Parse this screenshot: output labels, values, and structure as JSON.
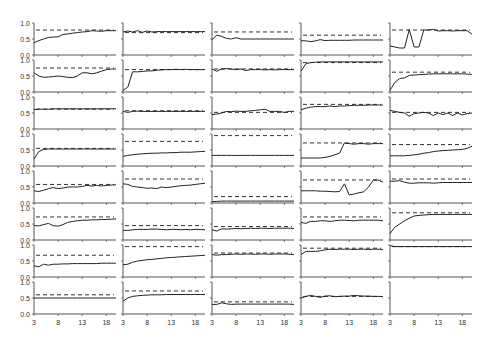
{
  "chart_data": {
    "type": "line",
    "layout": {
      "rows": 8,
      "cols": 5
    },
    "x": [
      3,
      4,
      5,
      6,
      7,
      8,
      9,
      10,
      11,
      12,
      13,
      14,
      15,
      16,
      17,
      18,
      19,
      20
    ],
    "xticks": [
      3,
      8,
      13,
      18
    ],
    "yticks": [
      0.0,
      0.5,
      1.0
    ],
    "ytick_labels": [
      "0.0",
      "0.5",
      "1.0"
    ],
    "xtick_labels": [
      "3",
      "8",
      "13",
      "18"
    ],
    "ylim": [
      0,
      1
    ],
    "xlim": [
      3,
      20
    ],
    "grid": false,
    "legend": null,
    "title": "",
    "xlabel": "",
    "ylabel": "",
    "series_style": {
      "solid": "observed",
      "dashed": "reference"
    },
    "panels": [
      {
        "row": 0,
        "col": 0,
        "ref": 0.78,
        "values": [
          0.38,
          0.45,
          0.5,
          0.55,
          0.56,
          0.57,
          0.64,
          0.66,
          0.68,
          0.7,
          0.72,
          0.73,
          0.76,
          0.75,
          0.74,
          0.76,
          0.76,
          0.76
        ]
      },
      {
        "row": 0,
        "col": 1,
        "ref": 0.7,
        "values": [
          0.72,
          0.75,
          0.72,
          0.76,
          0.71,
          0.75,
          0.72,
          0.73,
          0.73,
          0.73,
          0.73,
          0.73,
          0.73,
          0.73,
          0.73,
          0.73,
          0.73,
          0.73
        ]
      },
      {
        "row": 0,
        "col": 2,
        "ref": 0.72,
        "values": [
          0.48,
          0.62,
          0.58,
          0.52,
          0.5,
          0.54,
          0.5,
          0.5,
          0.5,
          0.5,
          0.5,
          0.5,
          0.5,
          0.5,
          0.5,
          0.5,
          0.5,
          0.5
        ]
      },
      {
        "row": 0,
        "col": 3,
        "ref": 0.62,
        "values": [
          0.45,
          0.44,
          0.42,
          0.44,
          0.48,
          0.45,
          0.46,
          0.46,
          0.46,
          0.46,
          0.46,
          0.47,
          0.47,
          0.47,
          0.47,
          0.47,
          0.47,
          0.47
        ]
      },
      {
        "row": 0,
        "col": 4,
        "ref": 0.78,
        "values": [
          0.28,
          0.25,
          0.22,
          0.22,
          0.8,
          0.25,
          0.25,
          0.78,
          0.78,
          0.8,
          0.75,
          0.76,
          0.76,
          0.75,
          0.76,
          0.76,
          0.76,
          0.65
        ]
      },
      {
        "row": 1,
        "col": 0,
        "ref": 0.75,
        "values": [
          0.6,
          0.5,
          0.46,
          0.47,
          0.48,
          0.5,
          0.48,
          0.46,
          0.45,
          0.5,
          0.6,
          0.6,
          0.57,
          0.6,
          0.65,
          0.7,
          0.72,
          0.72
        ]
      },
      {
        "row": 1,
        "col": 1,
        "ref": 0.7,
        "values": [
          0.05,
          0.15,
          0.63,
          0.63,
          0.64,
          0.66,
          0.66,
          0.68,
          0.69,
          0.7,
          0.7,
          0.71,
          0.7,
          0.71,
          0.7,
          0.7,
          0.7,
          0.7
        ]
      },
      {
        "row": 1,
        "col": 2,
        "ref": 0.72,
        "values": [
          0.72,
          0.65,
          0.72,
          0.73,
          0.72,
          0.7,
          0.72,
          0.67,
          0.7,
          0.7,
          0.7,
          0.69,
          0.7,
          0.69,
          0.7,
          0.7,
          0.7,
          0.7
        ]
      },
      {
        "row": 1,
        "col": 3,
        "ref": 0.92,
        "values": [
          0.65,
          0.88,
          0.92,
          0.93,
          0.94,
          0.94,
          0.94,
          0.94,
          0.94,
          0.94,
          0.94,
          0.94,
          0.94,
          0.94,
          0.94,
          0.94,
          0.94,
          0.94
        ]
      },
      {
        "row": 1,
        "col": 4,
        "ref": 0.62,
        "values": [
          0.05,
          0.3,
          0.42,
          0.44,
          0.52,
          0.53,
          0.54,
          0.55,
          0.56,
          0.57,
          0.57,
          0.57,
          0.57,
          0.57,
          0.57,
          0.57,
          0.56,
          0.55
        ]
      },
      {
        "row": 2,
        "col": 0,
        "ref": 0.62,
        "values": [
          0.6,
          0.62,
          0.62,
          0.62,
          0.63,
          0.63,
          0.63,
          0.63,
          0.63,
          0.63,
          0.63,
          0.63,
          0.63,
          0.63,
          0.63,
          0.63,
          0.63,
          0.63
        ]
      },
      {
        "row": 2,
        "col": 1,
        "ref": 0.57,
        "values": [
          0.55,
          0.52,
          0.55,
          0.56,
          0.55,
          0.55,
          0.55,
          0.55,
          0.55,
          0.55,
          0.55,
          0.55,
          0.55,
          0.55,
          0.55,
          0.55,
          0.55,
          0.55
        ]
      },
      {
        "row": 2,
        "col": 2,
        "ref": 0.52,
        "values": [
          0.45,
          0.47,
          0.5,
          0.55,
          0.54,
          0.56,
          0.55,
          0.55,
          0.57,
          0.58,
          0.6,
          0.62,
          0.55,
          0.55,
          0.55,
          0.52,
          0.55,
          0.55
        ]
      },
      {
        "row": 2,
        "col": 3,
        "ref": 0.77,
        "values": [
          0.6,
          0.65,
          0.68,
          0.7,
          0.7,
          0.7,
          0.72,
          0.7,
          0.72,
          0.72,
          0.73,
          0.74,
          0.74,
          0.74,
          0.75,
          0.75,
          0.75,
          0.75
        ]
      },
      {
        "row": 2,
        "col": 4,
        "ref": 0.52,
        "values": [
          0.58,
          0.55,
          0.52,
          0.5,
          0.4,
          0.48,
          0.5,
          0.52,
          0.5,
          0.42,
          0.5,
          0.45,
          0.5,
          0.42,
          0.5,
          0.44,
          0.48,
          0.5
        ]
      },
      {
        "row": 3,
        "col": 0,
        "ref": 0.55,
        "values": [
          0.22,
          0.45,
          0.52,
          0.53,
          0.53,
          0.53,
          0.53,
          0.53,
          0.53,
          0.53,
          0.53,
          0.53,
          0.53,
          0.53,
          0.53,
          0.53,
          0.53,
          0.53
        ]
      },
      {
        "row": 3,
        "col": 1,
        "ref": 0.77,
        "values": [
          0.3,
          0.33,
          0.35,
          0.37,
          0.38,
          0.39,
          0.4,
          0.4,
          0.41,
          0.41,
          0.42,
          0.42,
          0.43,
          0.43,
          0.43,
          0.44,
          0.45,
          0.46
        ]
      },
      {
        "row": 3,
        "col": 2,
        "ref": 0.95,
        "values": [
          0.33,
          0.33,
          0.33,
          0.33,
          0.33,
          0.33,
          0.33,
          0.33,
          0.33,
          0.33,
          0.33,
          0.33,
          0.33,
          0.33,
          0.33,
          0.33,
          0.33,
          0.33
        ]
      },
      {
        "row": 3,
        "col": 3,
        "ref": 0.72,
        "values": [
          0.25,
          0.25,
          0.25,
          0.25,
          0.25,
          0.27,
          0.3,
          0.35,
          0.4,
          0.72,
          0.7,
          0.68,
          0.7,
          0.7,
          0.68,
          0.7,
          0.7,
          0.7
        ]
      },
      {
        "row": 3,
        "col": 4,
        "ref": 0.67,
        "values": [
          0.32,
          0.32,
          0.32,
          0.32,
          0.33,
          0.35,
          0.37,
          0.4,
          0.42,
          0.45,
          0.47,
          0.48,
          0.49,
          0.5,
          0.51,
          0.52,
          0.55,
          0.62
        ]
      },
      {
        "row": 4,
        "col": 0,
        "ref": 0.58,
        "values": [
          0.38,
          0.36,
          0.4,
          0.45,
          0.48,
          0.45,
          0.47,
          0.5,
          0.5,
          0.5,
          0.52,
          0.55,
          0.53,
          0.55,
          0.53,
          0.55,
          0.56,
          0.57
        ]
      },
      {
        "row": 4,
        "col": 1,
        "ref": 0.75,
        "values": [
          0.6,
          0.58,
          0.52,
          0.5,
          0.48,
          0.46,
          0.47,
          0.45,
          0.5,
          0.48,
          0.5,
          0.52,
          0.54,
          0.55,
          0.56,
          0.58,
          0.6,
          0.62
        ]
      },
      {
        "row": 4,
        "col": 2,
        "ref": 0.2,
        "values": [
          0.04,
          0.05,
          0.06,
          0.06,
          0.06,
          0.06,
          0.06,
          0.06,
          0.06,
          0.06,
          0.06,
          0.06,
          0.06,
          0.06,
          0.06,
          0.06,
          0.06,
          0.06
        ]
      },
      {
        "row": 4,
        "col": 3,
        "ref": 0.72,
        "values": [
          0.38,
          0.38,
          0.38,
          0.38,
          0.37,
          0.37,
          0.36,
          0.35,
          0.36,
          0.6,
          0.25,
          0.28,
          0.32,
          0.35,
          0.5,
          0.72,
          0.72,
          0.65
        ]
      },
      {
        "row": 4,
        "col": 4,
        "ref": 0.75,
        "values": [
          0.68,
          0.68,
          0.7,
          0.65,
          0.62,
          0.62,
          0.63,
          0.63,
          0.63,
          0.62,
          0.63,
          0.64,
          0.64,
          0.64,
          0.64,
          0.64,
          0.64,
          0.64
        ]
      },
      {
        "row": 5,
        "col": 0,
        "ref": 0.72,
        "values": [
          0.45,
          0.44,
          0.48,
          0.52,
          0.45,
          0.43,
          0.48,
          0.55,
          0.58,
          0.6,
          0.62,
          0.62,
          0.63,
          0.63,
          0.64,
          0.64,
          0.65,
          0.66
        ]
      },
      {
        "row": 5,
        "col": 1,
        "ref": 0.45,
        "values": [
          0.3,
          0.3,
          0.32,
          0.33,
          0.33,
          0.33,
          0.34,
          0.34,
          0.33,
          0.32,
          0.33,
          0.33,
          0.32,
          0.33,
          0.32,
          0.33,
          0.33,
          0.32
        ]
      },
      {
        "row": 5,
        "col": 2,
        "ref": 0.42,
        "values": [
          0.32,
          0.28,
          0.35,
          0.34,
          0.35,
          0.36,
          0.35,
          0.36,
          0.37,
          0.36,
          0.37,
          0.37,
          0.36,
          0.37,
          0.37,
          0.37,
          0.37,
          0.36
        ]
      },
      {
        "row": 5,
        "col": 3,
        "ref": 0.72,
        "values": [
          0.55,
          0.52,
          0.58,
          0.58,
          0.6,
          0.6,
          0.58,
          0.6,
          0.62,
          0.62,
          0.61,
          0.6,
          0.62,
          0.62,
          0.62,
          0.62,
          0.62,
          0.6
        ]
      },
      {
        "row": 5,
        "col": 4,
        "ref": 0.85,
        "values": [
          0.2,
          0.4,
          0.5,
          0.6,
          0.68,
          0.75,
          0.77,
          0.78,
          0.79,
          0.8,
          0.8,
          0.8,
          0.8,
          0.8,
          0.8,
          0.8,
          0.8,
          0.8
        ]
      },
      {
        "row": 6,
        "col": 0,
        "ref": 0.68,
        "values": [
          0.35,
          0.32,
          0.4,
          0.37,
          0.4,
          0.4,
          0.41,
          0.41,
          0.42,
          0.42,
          0.42,
          0.42,
          0.42,
          0.42,
          0.43,
          0.43,
          0.43,
          0.43
        ]
      },
      {
        "row": 6,
        "col": 1,
        "ref": 0.95,
        "values": [
          0.38,
          0.4,
          0.46,
          0.5,
          0.52,
          0.54,
          0.55,
          0.57,
          0.58,
          0.6,
          0.61,
          0.62,
          0.63,
          0.64,
          0.65,
          0.66,
          0.67,
          0.68
        ]
      },
      {
        "row": 6,
        "col": 2,
        "ref": 0.75,
        "values": [
          0.7,
          0.68,
          0.7,
          0.7,
          0.71,
          0.72,
          0.71,
          0.72,
          0.72,
          0.71,
          0.72,
          0.72,
          0.71,
          0.72,
          0.72,
          0.72,
          0.71,
          0.7
        ]
      },
      {
        "row": 6,
        "col": 3,
        "ref": 0.9,
        "values": [
          0.7,
          0.8,
          0.8,
          0.8,
          0.82,
          0.85,
          0.87,
          0.86,
          0.87,
          0.87,
          0.87,
          0.86,
          0.87,
          0.87,
          0.86,
          0.87,
          0.87,
          0.86
        ]
      },
      {
        "row": 6,
        "col": 4,
        "ref": 0.95,
        "values": [
          0.98,
          0.95,
          0.95,
          0.95,
          0.95,
          0.95,
          0.95,
          0.95,
          0.95,
          0.95,
          0.95,
          0.95,
          0.95,
          0.95,
          0.95,
          0.95,
          0.95,
          0.95
        ]
      },
      {
        "row": 7,
        "col": 0,
        "ref": 0.6,
        "values": [
          0.5,
          0.5,
          0.5,
          0.5,
          0.5,
          0.5,
          0.5,
          0.5,
          0.5,
          0.5,
          0.5,
          0.5,
          0.5,
          0.5,
          0.5,
          0.5,
          0.5,
          0.5
        ]
      },
      {
        "row": 7,
        "col": 1,
        "ref": 0.72,
        "values": [
          0.4,
          0.5,
          0.55,
          0.57,
          0.58,
          0.59,
          0.6,
          0.6,
          0.6,
          0.61,
          0.61,
          0.61,
          0.61,
          0.61,
          0.61,
          0.61,
          0.61,
          0.61
        ]
      },
      {
        "row": 7,
        "col": 2,
        "ref": 0.38,
        "values": [
          0.3,
          0.3,
          0.35,
          0.32,
          0.3,
          0.31,
          0.31,
          0.31,
          0.31,
          0.31,
          0.31,
          0.31,
          0.31,
          0.31,
          0.31,
          0.31,
          0.31,
          0.3
        ]
      },
      {
        "row": 7,
        "col": 3,
        "ref": 0.55,
        "values": [
          0.5,
          0.55,
          0.58,
          0.55,
          0.52,
          0.56,
          0.57,
          0.54,
          0.55,
          0.56,
          0.56,
          0.58,
          0.57,
          0.56,
          0.56,
          0.55,
          0.55,
          0.54
        ]
      },
      {
        "row": 7,
        "col": 4,
        "ref": null,
        "values": []
      }
    ]
  }
}
